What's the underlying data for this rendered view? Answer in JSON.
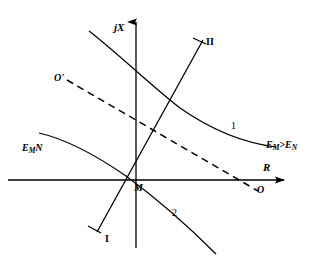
{
  "figure": {
    "background_color": "#ffffff",
    "stroke_color": "#000000",
    "width": 318,
    "height": 258
  },
  "axes": {
    "vertical": {
      "name": "reactance-axis",
      "label": "jX",
      "label_x": 114,
      "label_y": 22,
      "x": 136,
      "y_top": 18,
      "y_bottom": 248
    },
    "horizontal": {
      "name": "resistance-axis",
      "label": "R",
      "label_x": 263,
      "label_y": 162,
      "y": 180,
      "x_left": 8,
      "x_right": 290
    }
  },
  "points": {
    "M": {
      "label": "M",
      "label_x": 134,
      "label_y": 183,
      "x": 130,
      "y": 178
    },
    "O": {
      "label": "O",
      "label_x": 257,
      "label_y": 185,
      "x": 252,
      "y": 190
    },
    "O_prime": {
      "label": "O'",
      "label_x": 54,
      "label_y": 73,
      "x": 68,
      "y": 80
    }
  },
  "curves": [
    {
      "name": "curve-1",
      "label": "1",
      "label_x": 231,
      "label_y": 121,
      "annotation": "E<sub>M</sub>>E<sub>N</sub>",
      "annotation_text": "EM>EN",
      "annotation_x": 266,
      "annotation_y": 140,
      "style": "solid",
      "path": "M 89,31 C 120,55 150,85 180,108 C 210,129 244,143 276,147"
    },
    {
      "name": "curve-2",
      "label": "2",
      "label_x": 172,
      "label_y": 208,
      "annotation": "E<sub>M</sub><E<sub>N</sub>",
      "annotation_text": "EM<EN",
      "annotation_x": 22,
      "annotation_y": 143,
      "style": "solid",
      "path": "M 39,133 C 70,140 100,158 126,176 C 156,198 190,228 216,254"
    }
  ],
  "lines": [
    {
      "name": "line-I-II",
      "style": "solid",
      "label_start": "I",
      "label_start_x": 105,
      "label_start_y": 234,
      "label_end": "II",
      "label_end_x": 206,
      "label_end_y": 37,
      "x1": 97,
      "y1": 232,
      "x2": 203,
      "y2": 40,
      "has_end_ticks": true
    },
    {
      "name": "line-OO-prime-dashed",
      "style": "dashed",
      "dash_pattern": "7,5",
      "x1": 67,
      "y1": 80,
      "x2": 258,
      "y2": 191
    }
  ],
  "arrows": {
    "vertical_axis_arrow": "up",
    "horizontal_axis_arrow": "right"
  }
}
